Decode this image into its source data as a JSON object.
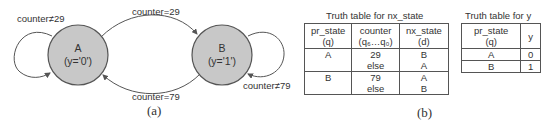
{
  "diagram": {
    "states": [
      {
        "name": "A",
        "output": "(y='0')"
      },
      {
        "name": "B",
        "output": "(y='1')"
      }
    ],
    "transitions": [
      {
        "label": "counter≠29",
        "from": "A",
        "to": "A"
      },
      {
        "label": "counter=29",
        "from": "A",
        "to": "B"
      },
      {
        "label": "counter=79",
        "from": "B",
        "to": "A"
      },
      {
        "label": "counter≠79",
        "from": "B",
        "to": "B"
      }
    ],
    "state_fill": "#c8c8c8",
    "caption": "(a)"
  },
  "nx_table": {
    "title": "Truth table for nx_state",
    "headers": [
      {
        "line1": "pr_state",
        "line2": "(q)"
      },
      {
        "line1": "counter",
        "line2": "(q₆…q₀)"
      },
      {
        "line1": "nx_state",
        "line2": "(d)"
      }
    ],
    "rows": [
      {
        "pr_state": "A",
        "counter": [
          "29",
          "else"
        ],
        "nx_state": [
          "B",
          "A"
        ]
      },
      {
        "pr_state": "B",
        "counter": [
          "79",
          "else"
        ],
        "nx_state": [
          "A",
          "B"
        ]
      }
    ],
    "caption": "(b)"
  },
  "y_table": {
    "title": "Truth table for y",
    "headers": [
      {
        "line1": "pr_state",
        "line2": "(q)"
      },
      {
        "line1": "y",
        "line2": ""
      }
    ],
    "rows": [
      {
        "pr_state": "A",
        "y": "0"
      },
      {
        "pr_state": "B",
        "y": "1"
      }
    ]
  }
}
